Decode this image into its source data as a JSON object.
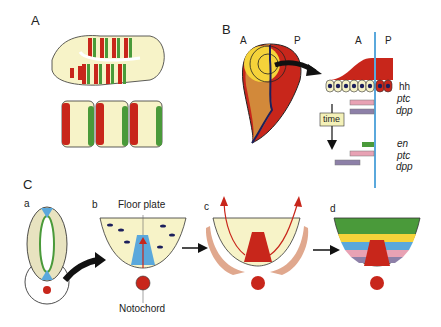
{
  "panels": {
    "A": {
      "label": "A"
    },
    "B": {
      "label": "B",
      "disc_labels": {
        "anterior": "A",
        "posterior": "P"
      },
      "section_labels": {
        "anterior": "A",
        "posterior": "P"
      },
      "genes_top": [
        "hh",
        "ptc",
        "dpp"
      ],
      "time_label": "time",
      "genes_bottom": [
        "en",
        "ptc",
        "dpp"
      ]
    },
    "C": {
      "label": "C",
      "sub": {
        "a": "a",
        "b": "b",
        "c": "c",
        "d": "d"
      },
      "floor_plate": "Floor plate",
      "notochord": "Notochord"
    }
  },
  "colors": {
    "red": "#c8261b",
    "green": "#4a9a3a",
    "cream": "#f7f3c8",
    "blue": "#5aa8dc",
    "yellow": "#f5d33a",
    "orange": "#d2893a",
    "navy": "#1c1f5c",
    "pink": "#e8a2b4",
    "purple": "#8d80a8"
  }
}
